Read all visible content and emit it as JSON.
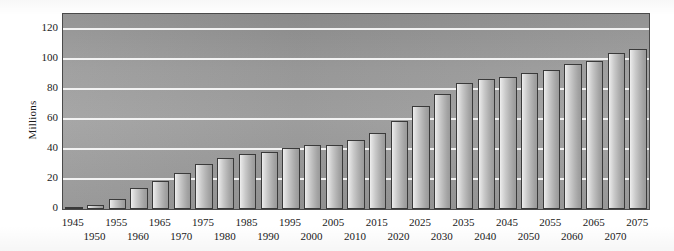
{
  "chart_data": {
    "type": "bar",
    "title": "",
    "xlabel": "",
    "ylabel": "Millions",
    "ylim": [
      0,
      130
    ],
    "yticks": [
      0,
      20,
      40,
      60,
      80,
      100,
      120
    ],
    "grid": true,
    "legend": "none",
    "categories": [
      "1945",
      "1950",
      "1955",
      "1960",
      "1965",
      "1970",
      "1975",
      "1980",
      "1985",
      "1990",
      "1995",
      "2000",
      "2005",
      "2010",
      "2015",
      "2020",
      "2025",
      "2030",
      "2035",
      "2040",
      "2045",
      "2050",
      "2055",
      "2060",
      "2065",
      "2070",
      "2075"
    ],
    "values": [
      1,
      3,
      7,
      14,
      19,
      24,
      30,
      34,
      37,
      38,
      41,
      43,
      43,
      46,
      51,
      59,
      69,
      77,
      84,
      87,
      88,
      91,
      93,
      97,
      99,
      104,
      107
    ],
    "bar_color_light": "#efefef",
    "bar_color_dark": "#9a9a9a",
    "bar_border_color": "#3a3a3a",
    "panel_color": "#9c9c9c",
    "gridline_color": "#f2f2f2"
  }
}
